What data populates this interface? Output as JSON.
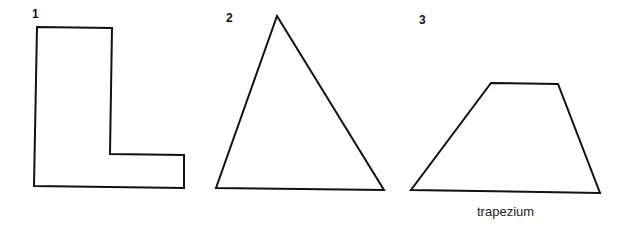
{
  "figure": {
    "shapes": [
      {
        "number": "1",
        "type": "L-shape",
        "points": "37,27 112,28 110,154 184,155 184,188 34,186"
      },
      {
        "number": "2",
        "type": "triangle",
        "points": "277,16 384,190 216,188"
      },
      {
        "number": "3",
        "type": "trapezium",
        "caption": "trapezium",
        "points": "491,83 558,84 600,193 411,190"
      }
    ],
    "stroke_color": "#111111",
    "background": "#ffffff"
  }
}
